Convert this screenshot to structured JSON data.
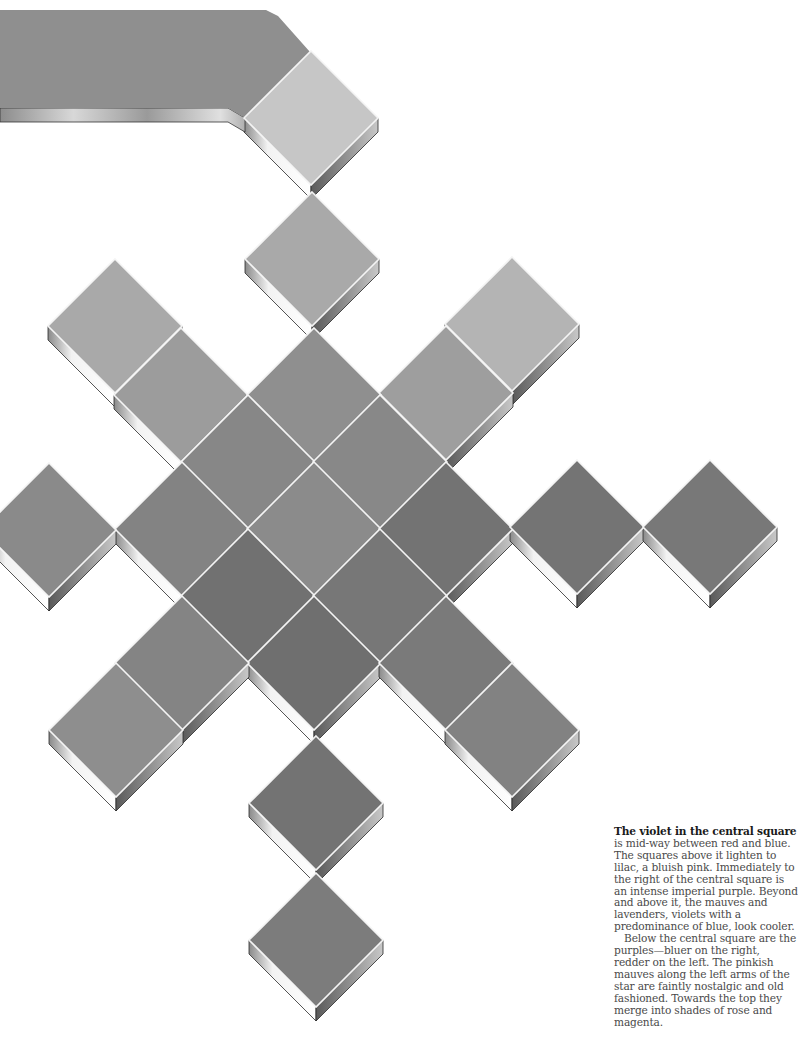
{
  "page": {
    "background": "#ffffff"
  },
  "artwork": {
    "description": "Star pattern of tilted square tiles in shades of gray (violet color study)",
    "tile_half_diagonal": 67,
    "slab_thickness": 14,
    "grout_color": "#f4f4f4",
    "banner": {
      "color": "#8f8f8f",
      "points": [
        [
          0,
          10
        ],
        [
          266,
          10
        ],
        [
          278,
          16
        ],
        [
          310,
          52
        ],
        [
          245,
          118
        ],
        [
          228,
          108
        ],
        [
          0,
          108
        ]
      ]
    },
    "tiles": [
      {
        "name": "top-tile",
        "cx": 311,
        "cy": 118,
        "color": "#c6c6c6"
      },
      {
        "name": "upper-arm-tile",
        "cx": 312,
        "cy": 259,
        "color": "#a9a9a9"
      },
      {
        "name": "upper-left-outer-tile",
        "cx": 115,
        "cy": 326,
        "color": "#a9a9a9"
      },
      {
        "name": "upper-left-inner-tile",
        "cx": 181,
        "cy": 395,
        "color": "#9c9c9c"
      },
      {
        "name": "upper-right-outer-tile",
        "cx": 512,
        "cy": 324,
        "color": "#b4b4b4"
      },
      {
        "name": "upper-right-inner-tile",
        "cx": 446,
        "cy": 393,
        "color": "#9e9e9e"
      },
      {
        "name": "core-top-tile",
        "cx": 314,
        "cy": 395,
        "color": "#8f8f8f"
      },
      {
        "name": "core-upper-left-tile",
        "cx": 248,
        "cy": 462,
        "color": "#878787"
      },
      {
        "name": "core-upper-right-tile",
        "cx": 380,
        "cy": 462,
        "color": "#888888"
      },
      {
        "name": "core-left-tile",
        "cx": 182,
        "cy": 529,
        "color": "#838383"
      },
      {
        "name": "central-square-tile",
        "cx": 314,
        "cy": 529,
        "color": "#8b8b8b"
      },
      {
        "name": "core-right-tile",
        "cx": 446,
        "cy": 529,
        "color": "#737373"
      },
      {
        "name": "core-lower-left-tile",
        "cx": 248,
        "cy": 596,
        "color": "#717171"
      },
      {
        "name": "core-lower-right-tile",
        "cx": 380,
        "cy": 596,
        "color": "#777777"
      },
      {
        "name": "core-bottom-tile",
        "cx": 314,
        "cy": 663,
        "color": "#6f6f6f"
      },
      {
        "name": "lower-left-inner-tile",
        "cx": 182,
        "cy": 663,
        "color": "#848484"
      },
      {
        "name": "lower-left-outer-tile",
        "cx": 116,
        "cy": 730,
        "color": "#8e8e8e"
      },
      {
        "name": "lower-right-inner-tile",
        "cx": 446,
        "cy": 663,
        "color": "#7a7a7a"
      },
      {
        "name": "lower-right-outer-tile",
        "cx": 512,
        "cy": 730,
        "color": "#828282"
      },
      {
        "name": "left-arm-tile",
        "cx": 49,
        "cy": 530,
        "color": "#8a8a8a"
      },
      {
        "name": "right-arm-inner-tile",
        "cx": 577,
        "cy": 527,
        "color": "#747474"
      },
      {
        "name": "right-arm-outer-tile",
        "cx": 710,
        "cy": 527,
        "color": "#787878"
      },
      {
        "name": "bottom-arm-inner-tile",
        "cx": 316,
        "cy": 803,
        "color": "#737373"
      },
      {
        "name": "bottom-arm-outer-tile",
        "cx": 316,
        "cy": 940,
        "color": "#7c7c7c"
      }
    ]
  },
  "caption": {
    "lead": "The violet in the central square",
    "paragraph1": "is mid-way between red and blue. The squares above it lighten to lilac, a bluish pink. Immediately to the right of the central square is an intense imperial purple. Beyond and above it, the mauves and lavenders, violets with a predominance of blue, look cooler.",
    "paragraph2": "Below the central square are the purples—bluer on the right, redder on the left. The pinkish mauves along the left arms of the star are faintly nostalgic and old fashioned. Towards the top they merge into shades of rose and magenta."
  }
}
